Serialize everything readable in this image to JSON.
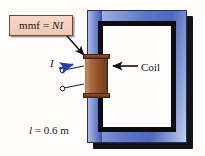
{
  "figure": {
    "background_color": "#fdfcfa"
  },
  "callout": {
    "mmf_prefix": "mmf = ",
    "mmf_variable": "NI",
    "box_fill": "#f2cdbb",
    "box_border": "#6b4a3c"
  },
  "labels": {
    "coil": "Coil",
    "current_symbol": "I",
    "length_symbol": "l",
    "length_value": " = 0.6 m"
  },
  "core": {
    "fill_light": "#b9c9ea",
    "fill_mid": "#6379c6",
    "fill_dark": "#4f66bb",
    "inner_edge": "#0d0c12",
    "window_fill": "#fdfcfa",
    "shadow": "#15131a"
  },
  "coil": {
    "winding_color": "#9c5730",
    "flange_color": "#7a4020",
    "turn_line_color": "#6d3618"
  },
  "arrows": {
    "mmf_pointer_color": "#101014",
    "coil_pointer_color": "#101014",
    "current_arrow_color": "#2b3fa6",
    "lead_wire_color": "#1b1b1f"
  }
}
